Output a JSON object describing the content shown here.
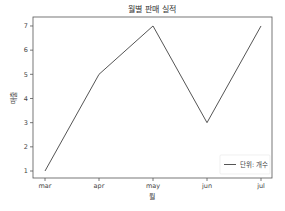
{
  "chart_data": {
    "type": "line",
    "title": "월별 판매 실적",
    "xlabel": "월",
    "ylabel": "매출",
    "categories": [
      "mar",
      "apr",
      "may",
      "jun",
      "jul"
    ],
    "series": [
      {
        "name": "단위: 개수",
        "values": [
          1,
          5,
          7,
          3,
          7
        ],
        "color": "#555555"
      }
    ],
    "yticks": [
      1,
      2,
      3,
      4,
      5,
      6,
      7
    ],
    "ylim": [
      0.7,
      7.4
    ],
    "grid": false,
    "legend_position": "lower right"
  }
}
